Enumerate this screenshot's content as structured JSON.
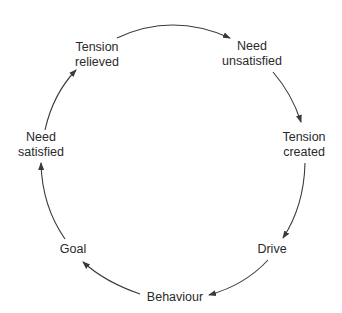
{
  "diagram": {
    "type": "cycle",
    "direction": "clockwise",
    "stroke_color": "#3a3a3a",
    "text_color": "#2a2a2a",
    "nodes": [
      {
        "id": "need-unsatisfied",
        "line1": "Need",
        "line2": "unsatisfied"
      },
      {
        "id": "tension-created",
        "line1": "Tension",
        "line2": "created"
      },
      {
        "id": "drive",
        "line1": "Drive",
        "line2": ""
      },
      {
        "id": "behaviour",
        "line1": "Behaviour",
        "line2": ""
      },
      {
        "id": "goal",
        "line1": "Goal",
        "line2": ""
      },
      {
        "id": "need-satisfied",
        "line1": "Need",
        "line2": "satisfied"
      },
      {
        "id": "tension-relieved",
        "line1": "Tension",
        "line2": "relieved"
      }
    ],
    "edges": [
      {
        "from": "tension-relieved",
        "to": "need-unsatisfied"
      },
      {
        "from": "need-unsatisfied",
        "to": "tension-created"
      },
      {
        "from": "tension-created",
        "to": "drive"
      },
      {
        "from": "drive",
        "to": "behaviour"
      },
      {
        "from": "behaviour",
        "to": "goal"
      },
      {
        "from": "goal",
        "to": "need-satisfied"
      },
      {
        "from": "need-satisfied",
        "to": "tension-relieved"
      }
    ]
  }
}
